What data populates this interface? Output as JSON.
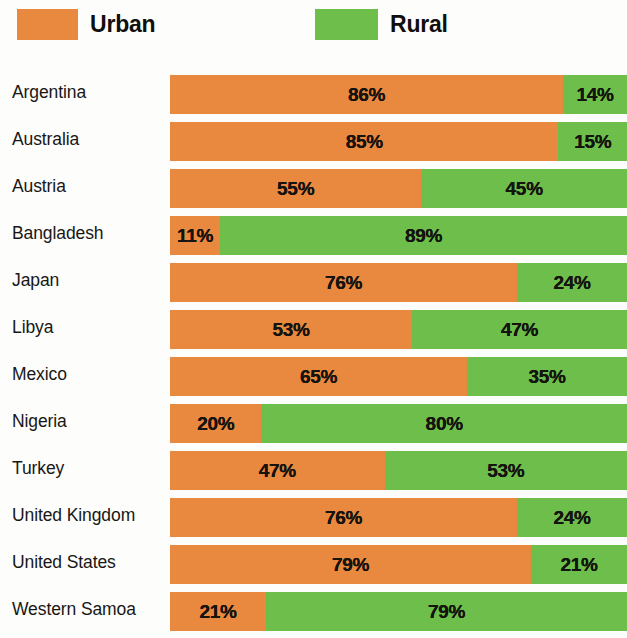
{
  "legend": {
    "items": [
      {
        "label": "Urban",
        "color": "#e9883f",
        "icon": "legend-swatch-urban"
      },
      {
        "label": "Rural",
        "color": "#6dbe4a",
        "icon": "legend-swatch-rural"
      }
    ]
  },
  "colors": {
    "urban": "#e9883f",
    "rural": "#6dbe4a",
    "background": "#fdfdfb",
    "text": "#181715"
  },
  "chart_data": {
    "type": "bar",
    "subtype": "stacked-horizontal-100-percent",
    "title": "",
    "subtitle": "",
    "xlabel": "",
    "ylabel": "",
    "xlim": [
      0,
      100
    ],
    "grid": false,
    "legend_position": "top",
    "categories": [
      "Argentina",
      "Australia",
      "Austria",
      "Bangladesh",
      "Japan",
      "Libya",
      "Mexico",
      "Nigeria",
      "Turkey",
      "United Kingdom",
      "United States",
      "Western Samoa"
    ],
    "series": [
      {
        "name": "Urban",
        "color": "#e9883f",
        "values": [
          86,
          85,
          55,
          11,
          76,
          53,
          65,
          20,
          47,
          76,
          79,
          21
        ],
        "labels": [
          "86%",
          "85%",
          "55%",
          "11%",
          "76%",
          "53%",
          "65%",
          "20%",
          "47%",
          "76%",
          "79%",
          "21%"
        ]
      },
      {
        "name": "Rural",
        "color": "#6dbe4a",
        "values": [
          14,
          15,
          45,
          89,
          24,
          47,
          35,
          80,
          53,
          24,
          21,
          79
        ],
        "labels": [
          "14%",
          "15%",
          "45%",
          "89%",
          "24%",
          "47%",
          "35%",
          "80%",
          "53%",
          "24%",
          "21%",
          "79%"
        ]
      }
    ],
    "rows": [
      {
        "category": "Argentina",
        "urban": 86,
        "rural": 14,
        "urban_label": "86%",
        "rural_label": "14%"
      },
      {
        "category": "Australia",
        "urban": 85,
        "rural": 15,
        "urban_label": "85%",
        "rural_label": "15%"
      },
      {
        "category": "Austria",
        "urban": 55,
        "rural": 45,
        "urban_label": "55%",
        "rural_label": "45%"
      },
      {
        "category": "Bangladesh",
        "urban": 11,
        "rural": 89,
        "urban_label": "11%",
        "rural_label": "89%"
      },
      {
        "category": "Japan",
        "urban": 76,
        "rural": 24,
        "urban_label": "76%",
        "rural_label": "24%"
      },
      {
        "category": "Libya",
        "urban": 53,
        "rural": 47,
        "urban_label": "53%",
        "rural_label": "47%"
      },
      {
        "category": "Mexico",
        "urban": 65,
        "rural": 35,
        "urban_label": "65%",
        "rural_label": "35%"
      },
      {
        "category": "Nigeria",
        "urban": 20,
        "rural": 80,
        "urban_label": "20%",
        "rural_label": "80%"
      },
      {
        "category": "Turkey",
        "urban": 47,
        "rural": 53,
        "urban_label": "47%",
        "rural_label": "53%"
      },
      {
        "category": "United Kingdom",
        "urban": 76,
        "rural": 24,
        "urban_label": "76%",
        "rural_label": "24%"
      },
      {
        "category": "United States",
        "urban": 79,
        "rural": 21,
        "urban_label": "79%",
        "rural_label": "21%"
      },
      {
        "category": "Western Samoa",
        "urban": 21,
        "rural": 79,
        "urban_label": "21%",
        "rural_label": "79%"
      }
    ]
  }
}
